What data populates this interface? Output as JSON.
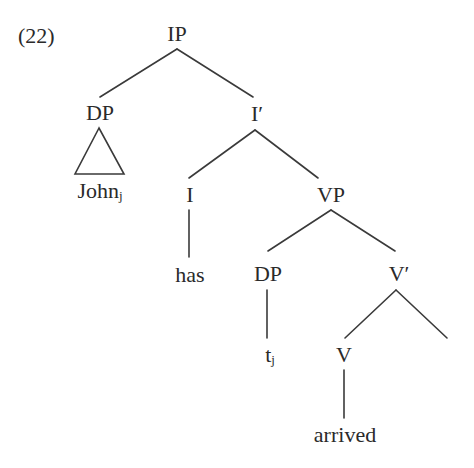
{
  "example": {
    "number": "(22)"
  },
  "tree": {
    "nodes": {
      "ip": {
        "label": "IP"
      },
      "dp_subject": {
        "label": "DP"
      },
      "john": {
        "label": "John",
        "index": "j"
      },
      "i_bar": {
        "label": "I′"
      },
      "i_head": {
        "label": "I"
      },
      "has": {
        "label": "has"
      },
      "vp": {
        "label": "VP"
      },
      "dp_trace": {
        "label": "DP"
      },
      "trace": {
        "label": "t",
        "index": "j"
      },
      "v_bar": {
        "label": "V′"
      },
      "v_head": {
        "label": "V"
      },
      "arrived": {
        "label": "arrived"
      }
    },
    "edges": [
      {
        "from": "IP",
        "to": "DP"
      },
      {
        "from": "IP",
        "to": "I′"
      },
      {
        "from": "DP",
        "to": "John_j",
        "style": "triangle"
      },
      {
        "from": "I′",
        "to": "I"
      },
      {
        "from": "I′",
        "to": "VP"
      },
      {
        "from": "I",
        "to": "has"
      },
      {
        "from": "VP",
        "to": "DP"
      },
      {
        "from": "VP",
        "to": "V′"
      },
      {
        "from": "DP",
        "to": "t_j"
      },
      {
        "from": "V′",
        "to": "V"
      },
      {
        "from": "V′",
        "to": "(empty)"
      },
      {
        "from": "V",
        "to": "arrived"
      }
    ]
  }
}
